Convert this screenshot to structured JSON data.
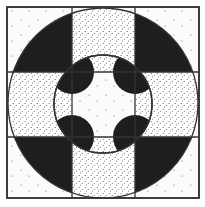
{
  "figure": {
    "title": "",
    "colors": {
      "background": "#fbfbfb",
      "ink": "#1e1e1e",
      "stroke": "#333333",
      "dot": "#555555"
    },
    "square": {
      "x": 7,
      "y": 7,
      "w": 192,
      "h": 191
    },
    "center": {
      "cx": 103,
      "cy": 103
    },
    "outer_circle_r": 95,
    "inner_circle_r": 49,
    "grid_x": [
      72,
      135
    ],
    "grid_y": [
      72,
      137
    ],
    "quarter_circle_r": 22,
    "regions": {
      "corner_cells_inside_outer_circle": "black",
      "edge_cells_inside_outer_circle": "dense-dotted",
      "outside_outer_circle": "sparse-dotted",
      "ring_between_inner_circle_and_center": "dense-dotted",
      "inside_inner_circle": "white-sparse-dotted",
      "central_quarter_circles": "black"
    }
  }
}
